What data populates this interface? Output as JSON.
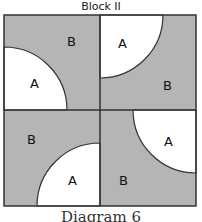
{
  "title": "Block II",
  "caption": "Diagram 6",
  "colors": {
    "shaded": "#b5b5b5",
    "unshaded": "#ffffff",
    "line": "#333333"
  },
  "quadrants": [
    {
      "position": "top-left",
      "arc_label": "A",
      "region_label": "B",
      "arc_corner": "bottom-left"
    },
    {
      "position": "top-right",
      "arc_label": "A",
      "region_label": "B",
      "arc_corner": "top-left"
    },
    {
      "position": "bottom-left",
      "arc_label": "A",
      "region_label": "B",
      "arc_corner": "bottom-right"
    },
    {
      "position": "bottom-right",
      "arc_label": "A",
      "region_label": "B",
      "arc_corner": "top-right"
    }
  ]
}
